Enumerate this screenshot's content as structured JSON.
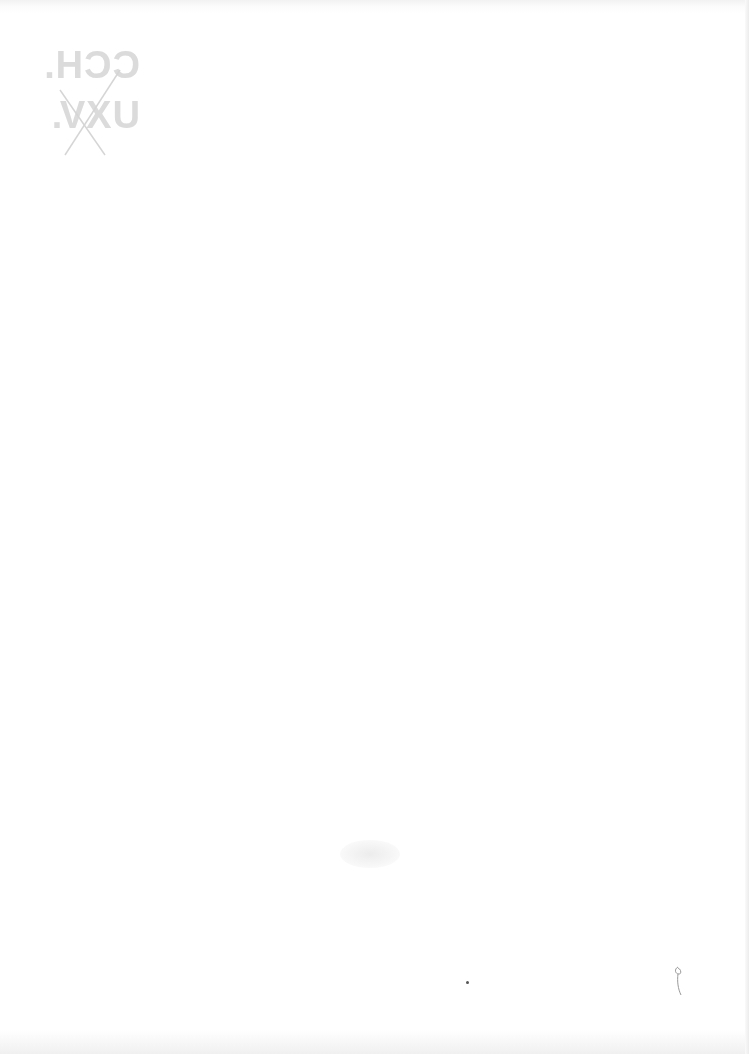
{
  "document": {
    "type": "blank scanned page",
    "bleed_through_mark": {
      "line1": "CCH.",
      "line2": "UXV.",
      "mirrored": true,
      "crossed_out": true
    },
    "colors": {
      "paper": "#ffffff",
      "bleed_mark": "#cfcfcf",
      "ink_dot": "#555555"
    }
  }
}
